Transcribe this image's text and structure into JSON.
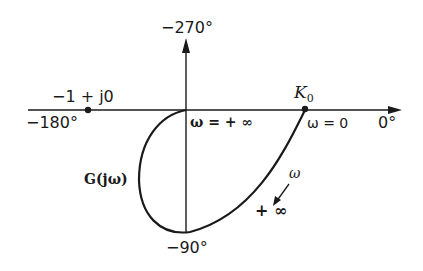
{
  "diagram": {
    "type": "nyquist-plot",
    "axis_labels": {
      "top": "−270°",
      "left": "−180°",
      "right": "0°",
      "bottom": "−90°"
    },
    "points": {
      "critical_point": "−1 + j0",
      "k0": "K",
      "k0_sub": "0"
    },
    "annotations": {
      "omega_inf_origin": "ω = + ∞",
      "omega_zero": "ω = 0",
      "curve_name": "G(jω)",
      "arrow_omega": "ω",
      "arrow_plus_inf": "+ ∞"
    },
    "colors": {
      "ink": "#1a1a1a",
      "background": "#ffffff"
    }
  }
}
